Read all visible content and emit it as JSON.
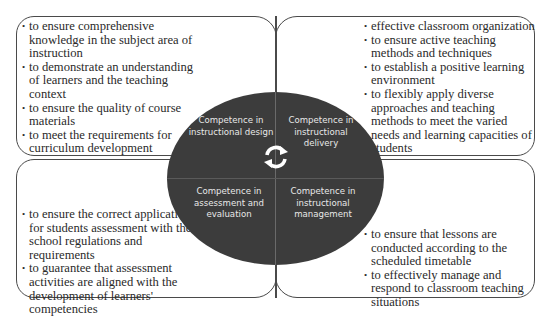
{
  "diagram": {
    "center": {
      "quadrants": {
        "top_left": "Competence in instructional design",
        "top_right": "Competence in instructional delivery",
        "bottom_left": "Competence in assessment and evaluation",
        "bottom_right": "Competence in instructional management"
      },
      "icon": "cycle-arrows-icon",
      "fill_color": "#3c3c3c",
      "text_color": "#e8e8e8"
    },
    "boxes": {
      "top_left": {
        "items": [
          "to ensure comprehensive knowledge in the subject area of instruction",
          "to demonstrate an understanding of learners and the teaching context",
          "to ensure the quality of course materials",
          "to meet the requirements for curriculum development"
        ]
      },
      "top_right": {
        "items": [
          "effective classroom organization",
          "to ensure active teaching methods and techniques",
          "to establish a positive learning environment",
          "to flexibly apply diverse approaches and teaching methods to meet the varied needs and learning capacities of students"
        ]
      },
      "bottom_left": {
        "items": [
          "to ensure the correct application for students assessment with the school regulations and requirements",
          "to guarantee that assessment activities are aligned with the development of learners' competencies"
        ]
      },
      "bottom_right": {
        "items": [
          "to ensure that lessons are conducted according to the scheduled timetable",
          "to effectively manage and respond to classroom teaching situations"
        ]
      }
    }
  }
}
